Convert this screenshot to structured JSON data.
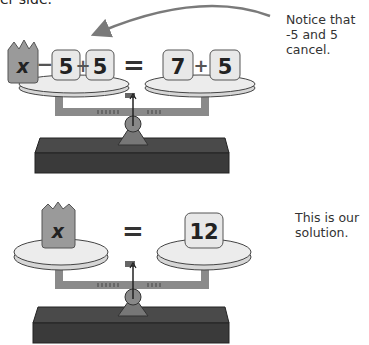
{
  "header": {
    "cut_text": "er side."
  },
  "annotations": {
    "top_note": "Notice that\n-5 and 5\ncancel.",
    "bottom_note": "This is our\nsolution."
  },
  "scale_top": {
    "left_pan": {
      "variable": "x",
      "op1": "−",
      "term1": "5",
      "op2": "+",
      "term2": "5"
    },
    "equals": "=",
    "right_pan": {
      "term1": "7",
      "op": "+",
      "term2": "5"
    }
  },
  "scale_bottom": {
    "left_pan": {
      "variable": "x"
    },
    "equals": "=",
    "right_pan": {
      "term1": "12"
    }
  },
  "colors": {
    "crown": "#9a9a9a",
    "tile": "#e8e8e8",
    "pan": "#e4e4e4",
    "beam": "#8a8a8a",
    "base": "#3e3e3e",
    "arrow": "#7a7a7a"
  }
}
